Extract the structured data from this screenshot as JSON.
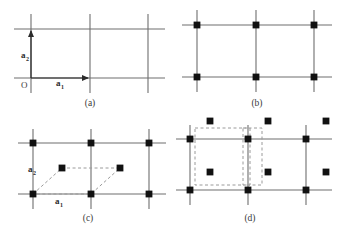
{
  "figure": {
    "background_color": "#ffffff",
    "line_color": "#6e6e6e",
    "dot_color": "#111111",
    "dash_color": "#9a9a9a",
    "arrow_color": "#2b2b2b",
    "panels": [
      {
        "id": "a",
        "caption": "(a)",
        "caption_x": 90,
        "caption_y": 106,
        "origin_label": "O",
        "origin_label_x": 22,
        "origin_label_y": 86,
        "vectors": [
          {
            "name": "a1",
            "label_base": "a",
            "label_sub": "1",
            "label_x": 56,
            "label_y": 86,
            "x1": 31,
            "y1": 78,
            "x2": 88,
            "y2": 78
          },
          {
            "name": "a2",
            "label_base": "a",
            "label_sub": "2",
            "label_x": 21,
            "label_y": 58,
            "x1": 31,
            "y1": 78,
            "x2": 31,
            "y2": 31
          }
        ],
        "grid": {
          "vertical_x": [
            31,
            90,
            148
          ],
          "horizontal_y": [
            29,
            78
          ],
          "v_top": 14,
          "v_bottom": 93,
          "h_left": 14,
          "h_right": 165
        },
        "lattice_points": []
      },
      {
        "id": "b",
        "caption": "(b)",
        "caption_x": 257,
        "caption_y": 106,
        "grid": {
          "vertical_x": [
            197,
            256,
            314
          ],
          "horizontal_y": [
            25,
            77
          ],
          "v_top": 10,
          "v_bottom": 92,
          "h_left": 182,
          "h_right": 332
        },
        "lattice_points": [
          {
            "x": 197,
            "y": 25
          },
          {
            "x": 256,
            "y": 25
          },
          {
            "x": 314,
            "y": 25
          },
          {
            "x": 197,
            "y": 77
          },
          {
            "x": 256,
            "y": 77
          },
          {
            "x": 314,
            "y": 77
          }
        ]
      },
      {
        "id": "c",
        "caption": "(c)",
        "caption_x": 88,
        "caption_y": 221,
        "grid": {
          "vertical_x": [
            33,
            91,
            149
          ],
          "horizontal_y": [
            143,
            194
          ],
          "v_top": 129,
          "v_bottom": 209,
          "h_left": 18,
          "h_right": 166
        },
        "lattice_points": [
          {
            "x": 33,
            "y": 143
          },
          {
            "x": 91,
            "y": 143
          },
          {
            "x": 149,
            "y": 143
          },
          {
            "x": 33,
            "y": 194
          },
          {
            "x": 91,
            "y": 194
          },
          {
            "x": 149,
            "y": 194
          },
          {
            "x": 62,
            "y": 168
          },
          {
            "x": 120,
            "y": 168
          }
        ],
        "primitive_cell": {
          "type": "parallelogram",
          "points": "33,194 62,168 120,168 91,194"
        },
        "vectors": [
          {
            "name": "a1",
            "label_base": "a",
            "label_sub": "1",
            "label_x": 58,
            "label_y": 203,
            "x1": 33,
            "y1": 194,
            "x2": 91,
            "y2": 194
          },
          {
            "name": "a2",
            "label_base": "a",
            "label_sub": "2",
            "label_x": 32,
            "label_y": 172,
            "x1": 33,
            "y1": 194,
            "x2": 62,
            "y2": 168
          }
        ]
      },
      {
        "id": "d",
        "caption": "(d)",
        "caption_x": 250,
        "caption_y": 221,
        "grid": {
          "vertical_x": [
            190,
            248,
            306
          ],
          "horizontal_y": [
            139,
            190
          ],
          "v_top": 125,
          "v_bottom": 205,
          "h_left": 176,
          "h_right": 332
        },
        "lattice_points": [
          {
            "x": 190,
            "y": 139
          },
          {
            "x": 248,
            "y": 139
          },
          {
            "x": 306,
            "y": 139
          },
          {
            "x": 190,
            "y": 190
          },
          {
            "x": 248,
            "y": 190
          },
          {
            "x": 306,
            "y": 190
          },
          {
            "x": 210,
            "y": 121
          },
          {
            "x": 268,
            "y": 121
          },
          {
            "x": 326,
            "y": 121
          },
          {
            "x": 210,
            "y": 172
          },
          {
            "x": 268,
            "y": 172
          },
          {
            "x": 326,
            "y": 172
          }
        ],
        "unit_cells": [
          {
            "name": "conventional-cell",
            "x": 195,
            "y": 128,
            "width": 55,
            "height": 57
          },
          {
            "name": "primitive-cell",
            "x": 243,
            "y": 128,
            "width": 19,
            "height": 57
          }
        ]
      }
    ]
  }
}
